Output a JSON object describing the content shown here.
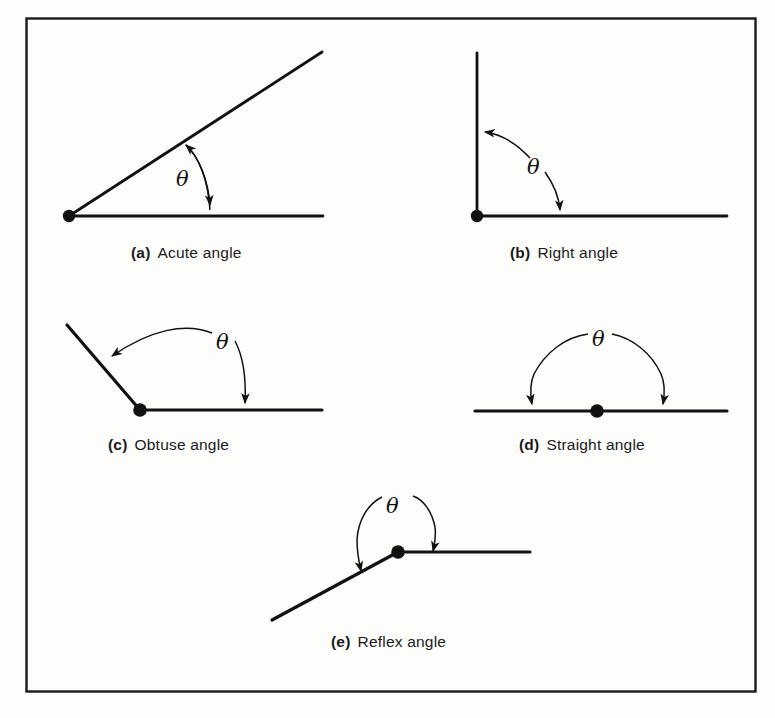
{
  "figure": {
    "type": "geometry-diagram",
    "border_color": "#1a1a1a",
    "line_color": "#111111",
    "background_color": "#fdfdfc",
    "angle_symbol": "θ"
  },
  "panels": [
    {
      "id": "a",
      "tag": "(a)",
      "label": "Acute angle",
      "angle_symbol": "θ",
      "description": "Two rays from a common vertex forming an acute angle; curved double-headed arrow marks the angle",
      "vertex": [
        69,
        216
      ],
      "rays": [
        [
          322,
          52
        ],
        [
          323,
          216
        ]
      ],
      "arc": {
        "start": [
          185,
          143
        ],
        "end": [
          212,
          216
        ],
        "arrowheads": "both"
      }
    },
    {
      "id": "b",
      "tag": "(b)",
      "label": "Right angle",
      "angle_symbol": "θ",
      "description": "Vertical ray and horizontal ray from a common vertex forming a 90 degree angle",
      "vertex": [
        477,
        216
      ],
      "rays": [
        [
          477,
          53
        ],
        [
          727,
          216
        ]
      ],
      "arc": {
        "start": [
          477,
          132
        ],
        "end": [
          560,
          216
        ],
        "arrowheads": "both"
      }
    },
    {
      "id": "c",
      "tag": "(c)",
      "label": "Obtuse angle",
      "angle_symbol": "θ",
      "description": "Ray going up-left and horizontal ray from a common vertex forming an obtuse angle",
      "vertex": [
        140,
        410
      ],
      "rays": [
        [
          67,
          325
        ],
        [
          322,
          410
        ]
      ],
      "arc": {
        "start": [
          101,
          364
        ],
        "end": [
          245,
          410
        ],
        "arrowheads": "both"
      }
    },
    {
      "id": "d",
      "tag": "(d)",
      "label": "Straight angle",
      "angle_symbol": "θ",
      "description": "Straight horizontal line with a vertex at its midpoint; semicircular arc spans 180 degrees",
      "vertex": [
        597,
        411
      ],
      "rays": [
        [
          475,
          411
        ],
        [
          727,
          411
        ]
      ],
      "arc": {
        "start": [
          532,
          411
        ],
        "end": [
          663,
          411
        ],
        "arrowheads": "both"
      }
    },
    {
      "id": "e",
      "tag": "(e)",
      "label": "Reflex angle",
      "angle_symbol": "θ",
      "description": "Horizontal ray to the right and a ray going down-left; arc measures the reflex (larger) angle over the top",
      "vertex": [
        398,
        552
      ],
      "rays": [
        [
          530,
          552
        ],
        [
          272,
          620
        ]
      ],
      "arc": {
        "start": [
          360,
          578
        ],
        "end": [
          432,
          558
        ],
        "arrowheads": "both"
      }
    }
  ],
  "border": {
    "x": 26,
    "y": 18,
    "width": 730,
    "height": 674
  }
}
